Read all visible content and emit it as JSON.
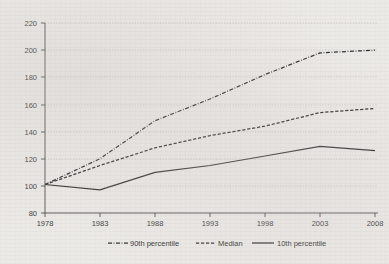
{
  "chart_data": {
    "type": "line",
    "title": "",
    "subtitle": "",
    "xlabel": "",
    "ylabel": "",
    "x": [
      1978,
      1983,
      1988,
      1993,
      1998,
      2003,
      2008
    ],
    "xticklabels": [
      "1978",
      "1983",
      "1988",
      "1993",
      "1998",
      "2003",
      "2008"
    ],
    "yticks": [
      80,
      100,
      120,
      140,
      160,
      180,
      200,
      220
    ],
    "yticklabels": [
      "80",
      "100",
      "120",
      "140",
      "160",
      "180",
      "200",
      "220"
    ],
    "xlim": [
      1978,
      2008
    ],
    "ylim": [
      80,
      220
    ],
    "grid": true,
    "legend_position": "bottom",
    "series": [
      {
        "name": "90th percentile",
        "style": "dash-dot",
        "color": "#2f2f2f",
        "values": [
          101,
          120,
          148,
          164,
          182,
          198,
          200
        ]
      },
      {
        "name": "Median",
        "style": "dashed",
        "color": "#2f2f2f",
        "values": [
          101,
          115,
          128,
          137,
          144,
          154,
          157
        ]
      },
      {
        "name": "10th percentile",
        "style": "solid",
        "color": "#2f2f2f",
        "values": [
          101,
          97,
          110,
          115,
          122,
          129,
          126
        ]
      }
    ]
  },
  "legend": {
    "items": [
      {
        "label": "90th percentile",
        "style": "dash-dot"
      },
      {
        "label": "Median",
        "style": "dashed"
      },
      {
        "label": "10th percentile",
        "style": "solid"
      }
    ]
  }
}
